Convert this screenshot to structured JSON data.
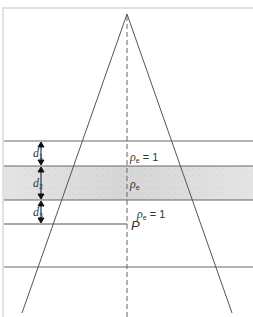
{
  "diagram": {
    "colors": {
      "line": "#555555",
      "frame": "#d8d8d8",
      "band_fill": "#d9d9d9",
      "text": "#333333"
    },
    "layers": [
      {
        "id": "d1",
        "symbol": "d",
        "subscript": "1",
        "density_label": "ρe = 1",
        "density_symbol": "ρ",
        "density_sub": "e",
        "density_value": "= 1",
        "shaded": false
      },
      {
        "id": "d2",
        "symbol": "d",
        "subscript": "2",
        "density_label": "ρe",
        "density_symbol": "ρ",
        "density_sub": "e",
        "density_value": "",
        "shaded": true
      },
      {
        "id": "d3",
        "symbol": "d",
        "subscript": "3",
        "density_label": "ρe = 1",
        "density_symbol": "ρ",
        "density_sub": "e",
        "density_value": "= 1",
        "shaded": false
      }
    ],
    "point_label": "P"
  }
}
